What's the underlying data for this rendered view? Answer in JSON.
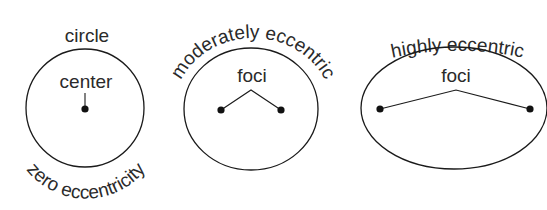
{
  "diagram": {
    "colors": {
      "stroke": "#1a1a1a",
      "text": "#2a2a2a",
      "background": "#ffffff"
    },
    "panels": [
      {
        "id": "circle",
        "shape": "circle",
        "top_label": "circle",
        "inner_label": "center",
        "bottom_label": "zero eccentricity",
        "points": 1
      },
      {
        "id": "moderate",
        "shape": "ellipse",
        "top_label": "moderately eccentric",
        "inner_label": "foci",
        "points": 2
      },
      {
        "id": "high",
        "shape": "ellipse",
        "top_label": "highly eccentric",
        "inner_label": "foci",
        "points": 2
      }
    ]
  }
}
